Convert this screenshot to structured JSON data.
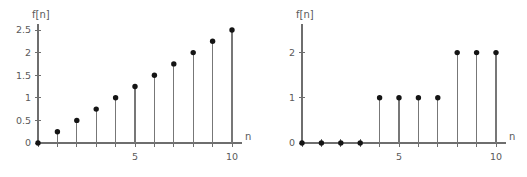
{
  "figure": {
    "background_color": "#ffffff",
    "axis_color": "#6e6e6e",
    "stem_color": "#777777",
    "marker_color": "#141414"
  },
  "chart_data": [
    {
      "type": "scatter",
      "name": "left-stem-plot",
      "title": "",
      "xlabel": "n",
      "ylabel": "f[n]",
      "x": [
        0,
        1,
        2,
        3,
        4,
        5,
        6,
        7,
        8,
        9,
        10
      ],
      "values": [
        0,
        0.25,
        0.5,
        0.75,
        1,
        1.25,
        1.5,
        1.75,
        2,
        2.25,
        2.5
      ],
      "xlim": [
        0,
        10
      ],
      "ylim": [
        0,
        2.5
      ],
      "xticks": [
        0,
        1,
        2,
        3,
        4,
        5,
        6,
        7,
        8,
        9,
        10
      ],
      "xtick_labels": [
        "",
        "",
        "",
        "",
        "",
        "5",
        "",
        "",
        "",
        "",
        "10"
      ],
      "yticks": [
        0,
        0.5,
        1,
        1.5,
        2,
        2.5
      ],
      "ytick_labels": [
        "0",
        "0.5",
        "1",
        "1.5",
        "2",
        "2.5"
      ],
      "grid": false,
      "legend": "none"
    },
    {
      "type": "scatter",
      "name": "right-stem-plot",
      "title": "",
      "xlabel": "n",
      "ylabel": "f[n]",
      "x": [
        0,
        1,
        2,
        3,
        4,
        5,
        6,
        7,
        8,
        9,
        10
      ],
      "values": [
        0,
        0,
        0,
        0,
        1,
        1,
        1,
        1,
        2,
        2,
        2
      ],
      "xlim": [
        0,
        10
      ],
      "ylim": [
        0,
        2.5
      ],
      "xticks": [
        0,
        1,
        2,
        3,
        4,
        5,
        6,
        7,
        8,
        9,
        10
      ],
      "xtick_labels": [
        "",
        "",
        "",
        "",
        "",
        "5",
        "",
        "",
        "",
        "",
        "10"
      ],
      "yticks": [
        0,
        1,
        2
      ],
      "ytick_labels": [
        "0",
        "1",
        "2"
      ],
      "grid": false,
      "legend": "none"
    }
  ]
}
